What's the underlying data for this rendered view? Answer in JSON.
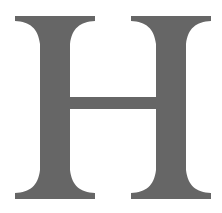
{
  "glyph": {
    "character": "H",
    "color": "#666666",
    "background": "#ffffff"
  }
}
